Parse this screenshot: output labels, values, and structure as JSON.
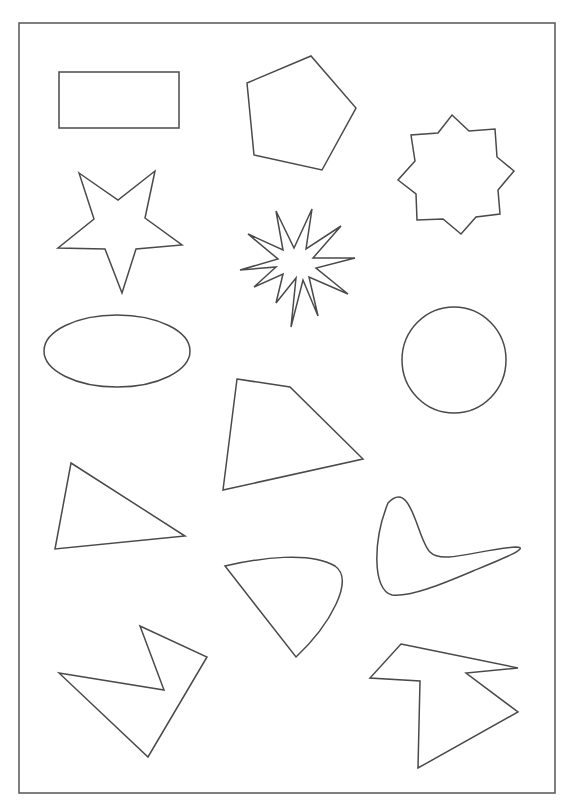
{
  "page": {
    "width": 574,
    "height": 812,
    "background": "#ffffff",
    "stroke_color": "#4a4a4a"
  },
  "frame": {
    "x": 19,
    "y": 23,
    "width": 536,
    "height": 770
  },
  "shapes": [
    {
      "name": "rectangle-shape",
      "kind": "rect",
      "x": 59,
      "y": 72,
      "width": 120,
      "height": 56
    },
    {
      "name": "pentagon-shape",
      "kind": "polygon",
      "points": "247,83 311,56 356,108 322,170 254,155"
    },
    {
      "name": "eight-point-star-shape",
      "kind": "polygon",
      "points": "452,115 469,131 495,129 497,157 514,171 498,190 500,214 476,217 461,234 443,219 417,220 416,194 398,180 415,161 411,135 438,133"
    },
    {
      "name": "five-point-star-shape",
      "kind": "polygon",
      "points": "79,173 118,200 155,171 145,218 182,245 136,249 122,293 105,249 58,248 94,219"
    },
    {
      "name": "twelve-point-starburst-shape",
      "kind": "polygon",
      "points": "291,327 296,278 276,303 283,274 254,287 276,267 240,270 278,259 248,234 283,250 276,211 294,248 312,209 306,249 341,226 313,258 355,258 316,268 348,294 309,277 318,316 303,280"
    },
    {
      "name": "ellipse-shape",
      "kind": "ellipse",
      "cx": 117,
      "cy": 351,
      "rx": 73,
      "ry": 36
    },
    {
      "name": "circle-shape",
      "kind": "ellipse",
      "cx": 454,
      "cy": 360,
      "rx": 52,
      "ry": 53
    },
    {
      "name": "quadrilateral-shape",
      "kind": "polygon",
      "points": "237,379 290,387 363,459 223,490"
    },
    {
      "name": "triangle-shape",
      "kind": "polygon",
      "points": "71,463 185,536 55,549"
    },
    {
      "name": "boomerang-shape",
      "kind": "path",
      "d": "M 388,503 C 412,478 417,540 430,552 C 442,565 480,549 516,547 C 533,547 495,562 473,571 C 440,585 410,597 392,595 C 372,590 373,540 388,503 Z"
    },
    {
      "name": "rounded-wedge-shape",
      "kind": "path",
      "d": "M 225,566 C 260,558 310,551 335,566 C 355,580 330,625 296,657 Z"
    },
    {
      "name": "zigzag-polygon-left-shape",
      "kind": "polygon",
      "points": "59,673 164,690 140,626 207,657 148,757"
    },
    {
      "name": "zigzag-polygon-right-shape",
      "kind": "polygon",
      "points": "401,644 518,668 466,673 518,712 418,768 420,681 370,678"
    }
  ]
}
